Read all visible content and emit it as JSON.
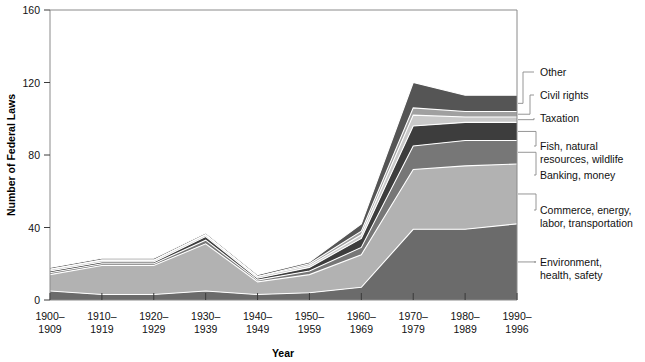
{
  "chart_data": {
    "type": "area",
    "stacked": true,
    "title": "",
    "xlabel": "Year",
    "ylabel": "Number of Federal Laws",
    "categories": [
      "1900–\n1909",
      "1910–\n1919",
      "1920–\n1929",
      "1930–\n1939",
      "1940–\n1949",
      "1950–\n1959",
      "1960–\n1969",
      "1970–\n1979",
      "1980–\n1989",
      "1990–\n1996"
    ],
    "category_lines": [
      [
        "1900–",
        "1909"
      ],
      [
        "1910–",
        "1919"
      ],
      [
        "1920–",
        "1929"
      ],
      [
        "1930–",
        "1939"
      ],
      [
        "1940–",
        "1949"
      ],
      [
        "1950–",
        "1959"
      ],
      [
        "1960–",
        "1969"
      ],
      [
        "1970–",
        "1979"
      ],
      [
        "1980–",
        "1989"
      ],
      [
        "1990–",
        "1996"
      ]
    ],
    "ylim": [
      0,
      160
    ],
    "yticks": [
      0,
      40,
      80,
      120,
      160
    ],
    "ytick_labels": [
      "0",
      "40",
      "80",
      "120",
      "160"
    ],
    "grid": false,
    "legend_position": "right-leader-lines",
    "series": [
      {
        "name": "Environment, health, safety",
        "color": "#6b6b6b",
        "values": [
          5,
          3,
          3,
          5,
          3,
          4,
          7,
          39,
          39,
          42
        ]
      },
      {
        "name": "Commerce, energy, labor, transportation",
        "color": "#b2b2b2",
        "values": [
          9,
          16,
          16,
          26,
          7,
          10,
          18,
          33,
          35,
          33
        ]
      },
      {
        "name": "Banking, money",
        "color": "#777777",
        "values": [
          1,
          1,
          1,
          2,
          1,
          2,
          4,
          13,
          14,
          13
        ]
      },
      {
        "name": "Fish, natural resources, wildlife",
        "color": "#3d3d3d",
        "values": [
          1,
          1,
          1,
          2,
          1,
          2,
          5,
          11,
          10,
          10
        ]
      },
      {
        "name": "Taxation",
        "color": "#c9c9c9",
        "values": [
          1,
          1,
          1,
          1,
          1,
          1,
          2,
          6,
          3,
          3
        ]
      },
      {
        "name": "Civil rights",
        "color": "#a0a0a0",
        "values": [
          0,
          0,
          0,
          0,
          0,
          1,
          2,
          4,
          3,
          3
        ]
      },
      {
        "name": "Other",
        "color": "#555555",
        "values": [
          1,
          1,
          1,
          1,
          1,
          1,
          4,
          14,
          9,
          9
        ]
      }
    ],
    "totals": [
      18,
      23,
      23,
      37,
      14,
      21,
      42,
      120,
      113,
      113
    ]
  },
  "legend": {
    "entries": [
      {
        "label_lines": [
          "Other"
        ]
      },
      {
        "label_lines": [
          "Civil rights"
        ]
      },
      {
        "label_lines": [
          "Taxation"
        ]
      },
      {
        "label_lines": [
          "Fish, natural",
          "resources, wildlife"
        ]
      },
      {
        "label_lines": [
          "Banking, money"
        ]
      },
      {
        "label_lines": [
          "Commerce, energy,",
          "labor, transportation"
        ]
      },
      {
        "label_lines": [
          "Environment,",
          "health, safety"
        ]
      }
    ]
  },
  "axes": {
    "y_title": "Number of Federal Laws",
    "x_title": "Year"
  }
}
